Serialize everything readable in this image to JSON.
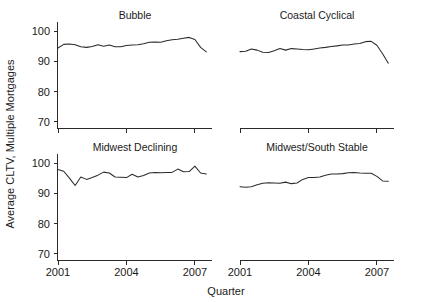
{
  "chart_data": {
    "type": "line",
    "title": "",
    "xlabel": "Quarter",
    "ylabel": "Average CLTV, Multiple Mortgages",
    "xlim": [
      2001.0,
      2007.75
    ],
    "ylim": [
      68,
      101
    ],
    "xticks": [
      2001,
      2004,
      2007
    ],
    "xticklabels": [
      "2001",
      "2004",
      "2007"
    ],
    "yticks": [
      70,
      80,
      90,
      100
    ],
    "yticklabels": [
      "70",
      "80",
      "90",
      "100"
    ],
    "grid": false,
    "legend": null,
    "layout": "2x2 small-multiples, shared x and y axes",
    "panels": [
      {
        "title": "Bubble",
        "row": 0,
        "col": 0,
        "x": [
          2001.0,
          2001.25,
          2001.5,
          2001.75,
          2002.0,
          2002.25,
          2002.5,
          2002.75,
          2003.0,
          2003.25,
          2003.5,
          2003.75,
          2004.0,
          2004.25,
          2004.5,
          2004.75,
          2005.0,
          2005.25,
          2005.5,
          2005.75,
          2006.0,
          2006.25,
          2006.5,
          2006.75,
          2007.0,
          2007.25,
          2007.5
        ],
        "y": [
          94.4,
          95.6,
          95.7,
          95.5,
          94.8,
          94.6,
          94.9,
          95.5,
          95.0,
          95.4,
          94.8,
          94.8,
          95.2,
          95.4,
          95.5,
          95.8,
          96.3,
          96.4,
          96.3,
          96.8,
          97.1,
          97.3,
          97.6,
          97.9,
          97.2,
          94.6,
          93.1
        ]
      },
      {
        "title": "Coastal Cyclical",
        "row": 0,
        "col": 1,
        "x": [
          2001.0,
          2001.25,
          2001.5,
          2001.75,
          2002.0,
          2002.25,
          2002.5,
          2002.75,
          2003.0,
          2003.25,
          2003.5,
          2003.75,
          2004.0,
          2004.25,
          2004.5,
          2004.75,
          2005.0,
          2005.25,
          2005.5,
          2005.75,
          2006.0,
          2006.25,
          2006.5,
          2006.75,
          2007.0,
          2007.25,
          2007.5
        ],
        "y": [
          93.2,
          93.3,
          94.1,
          93.7,
          93.0,
          92.9,
          93.5,
          94.2,
          93.7,
          94.2,
          94.1,
          93.9,
          93.8,
          94.1,
          94.4,
          94.6,
          94.9,
          95.1,
          95.4,
          95.4,
          95.7,
          95.9,
          96.5,
          96.6,
          95.3,
          92.5,
          89.4
        ]
      },
      {
        "title": "Midwest Declining",
        "row": 1,
        "col": 0,
        "x": [
          2001.0,
          2001.25,
          2001.5,
          2001.75,
          2002.0,
          2002.25,
          2002.5,
          2002.75,
          2003.0,
          2003.25,
          2003.5,
          2003.75,
          2004.0,
          2004.25,
          2004.5,
          2004.75,
          2005.0,
          2005.25,
          2005.5,
          2005.75,
          2006.0,
          2006.25,
          2006.5,
          2006.75,
          2007.0,
          2007.25,
          2007.5
        ],
        "y": [
          97.9,
          97.3,
          95.0,
          92.6,
          95.4,
          94.6,
          95.2,
          96.0,
          97.0,
          96.7,
          95.4,
          95.3,
          95.2,
          96.3,
          95.4,
          95.9,
          96.7,
          96.9,
          96.8,
          96.9,
          96.9,
          98.0,
          97.1,
          97.2,
          99.0,
          96.7,
          96.4
        ]
      },
      {
        "title": "Midwest/South Stable",
        "row": 1,
        "col": 1,
        "x": [
          2001.0,
          2001.25,
          2001.5,
          2001.75,
          2002.0,
          2002.25,
          2002.5,
          2002.75,
          2003.0,
          2003.25,
          2003.5,
          2003.75,
          2004.0,
          2004.25,
          2004.5,
          2004.75,
          2005.0,
          2005.25,
          2005.5,
          2005.75,
          2006.0,
          2006.25,
          2006.5,
          2006.75,
          2007.0,
          2007.25,
          2007.5
        ],
        "y": [
          92.2,
          92.0,
          92.2,
          92.8,
          93.3,
          93.5,
          93.4,
          93.3,
          93.7,
          93.2,
          93.4,
          94.6,
          95.2,
          95.2,
          95.4,
          96.0,
          96.4,
          96.4,
          96.5,
          96.8,
          96.9,
          96.7,
          96.6,
          96.6,
          95.6,
          94.1,
          94.0
        ]
      }
    ]
  }
}
